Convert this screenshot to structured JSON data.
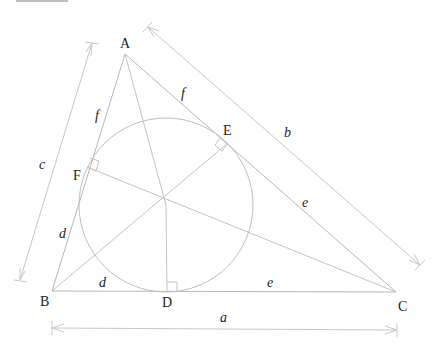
{
  "diagram": {
    "vertices": {
      "A": {
        "label": "A",
        "x": 125,
        "y": 54
      },
      "B": {
        "label": "B",
        "x": 52,
        "y": 291
      },
      "C": {
        "label": "C",
        "x": 396,
        "y": 292
      }
    },
    "incenter": {
      "x": 166,
      "y": 205
    },
    "inradius": 87,
    "tangent_points": {
      "D": {
        "label": "D",
        "x": 167,
        "y": 292
      },
      "E": {
        "label": "E",
        "x": 228,
        "y": 143
      },
      "F": {
        "label": "F",
        "x": 87,
        "y": 167
      }
    },
    "side_labels": {
      "a": "a",
      "b": "b",
      "c": "c"
    },
    "segment_labels": {
      "AF": "f",
      "AE": "f",
      "BF": "d",
      "BD": "d",
      "CD": "e",
      "CE": "e"
    },
    "colors": {
      "line": "#b8b8b8",
      "text": "#222222",
      "background": "#ffffff"
    }
  }
}
